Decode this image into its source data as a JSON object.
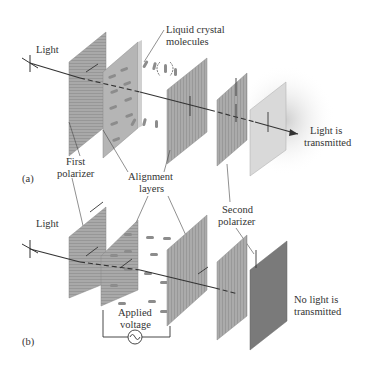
{
  "diagram": {
    "panel_a": {
      "id": "(a)",
      "light_label": "Light",
      "lc_label_line1": "Liquid crystal",
      "lc_label_line2": "molecules",
      "result_line1": "Light is",
      "result_line2": "transmitted"
    },
    "panel_b": {
      "id": "(b)",
      "light_label": "Light",
      "voltage_line1": "Applied",
      "voltage_line2": "voltage",
      "result_line1": "No light is",
      "result_line2": "transmitted"
    },
    "shared_labels": {
      "first_polarizer_line1": "First",
      "first_polarizer_line2": "polarizer",
      "alignment_line1": "Alignment",
      "alignment_line2": "layers",
      "second_polarizer_line1": "Second",
      "second_polarizer_line2": "polarizer"
    },
    "colors": {
      "panel": "#a8a8a8",
      "panel_dark": "#8a8a8a",
      "panel_light": "#d9d9d9",
      "dark_output": "#7a7a7a",
      "molecule": "#8c8c8c",
      "ray": "#333333"
    }
  }
}
